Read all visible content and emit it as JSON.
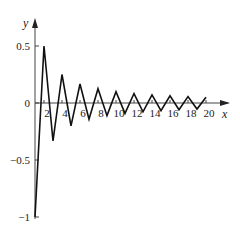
{
  "chart_data": {
    "type": "line",
    "title": "",
    "xlabel": "x",
    "ylabel": "y",
    "x_ticks": [
      "2",
      "4",
      "6",
      "8",
      "10",
      "12",
      "14",
      "16",
      "18",
      "20"
    ],
    "y_ticks": [
      "0.5",
      "0",
      "-0.5",
      "-1"
    ],
    "ylim": [
      -1,
      0.6
    ],
    "xlim": [
      0,
      21
    ],
    "grid": false,
    "legend": null,
    "series": [
      {
        "name": "(-1)^n / n",
        "x": [
          1,
          2,
          3,
          4,
          5,
          6,
          7,
          8,
          9,
          10,
          11,
          12,
          13,
          14,
          15,
          16,
          17,
          18,
          19,
          20
        ],
        "values": [
          -1,
          0.5,
          -0.333,
          0.25,
          -0.2,
          0.167,
          -0.143,
          0.125,
          -0.111,
          0.1,
          -0.091,
          0.083,
          -0.077,
          0.071,
          -0.067,
          0.0625,
          -0.059,
          0.056,
          -0.053,
          0.05
        ]
      }
    ]
  }
}
